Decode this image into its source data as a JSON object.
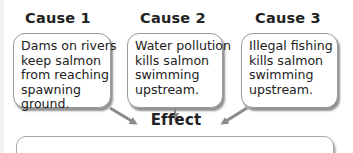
{
  "causes": [
    {
      "title": "Cause 1",
      "lines": [
        "Dams on rivers",
        "keep salmon",
        "from reaching",
        "spawning",
        "ground."
      ]
    },
    {
      "title": "Cause 2",
      "lines": [
        "Water pollution",
        "kills salmon",
        "swimming",
        "upstream."
      ]
    },
    {
      "title": "Cause 3",
      "lines": [
        "Illegal fishing",
        "kills salmon",
        "swimming",
        "upstream."
      ]
    }
  ],
  "effect": {
    "title": "Effect",
    "text": ""
  },
  "colors": {
    "arrow": "#8a8a8a",
    "border": "#9a9a9a"
  }
}
